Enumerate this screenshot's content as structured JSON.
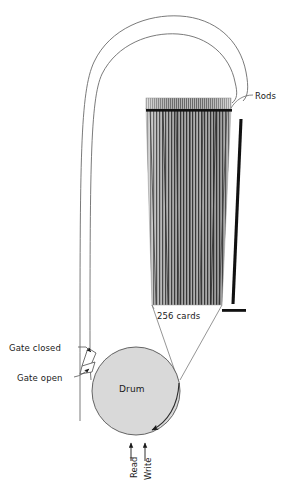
{
  "diagram": {
    "labels": {
      "rods": "Rods",
      "cards": "256 cards",
      "gate_closed": "Gate closed",
      "gate_open": "Gate open",
      "drum": "Drum",
      "read": "Read",
      "write": "Write"
    },
    "colors": {
      "stroke": "#444444",
      "rod_black": "#111111",
      "drum_fill": "#d9d9d9",
      "drum_stroke": "#555555",
      "card_dark": "#4a4a4a",
      "card_light": "#cfcfcf",
      "background": "#ffffff",
      "text": "#1a1a1a"
    },
    "geometry": {
      "card_count": 256,
      "stack_top_y": 98,
      "stack_bottom_y": 305,
      "drum_center_x": 136,
      "drum_center_y": 391,
      "drum_radius": 44
    }
  }
}
